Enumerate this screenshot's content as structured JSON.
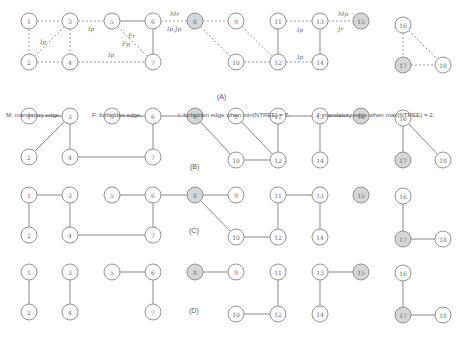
{
  "panels": [
    {
      "id": "A",
      "label": "(A)",
      "label_pos": [
        217,
        99
      ]
    },
    {
      "id": "B",
      "label": "(B)",
      "label_pos": [
        190,
        169
      ]
    },
    {
      "id": "C",
      "label": "(C)",
      "label_pos": [
        189,
        233
      ]
    },
    {
      "id": "D",
      "label": "(D)",
      "label_pos": [
        189,
        313
      ]
    }
  ],
  "legend": {
    "mandatory": "M: mandatory edge.",
    "forbidden": "F: forbidden edge.",
    "forbidden_when": "I: forbidden edge when min(NTREE) = 7.",
    "mandatory_when": "J: mandatory edge when max(NTREE) = 2."
  },
  "shaded_nodes": [
    8,
    15,
    17
  ],
  "graphs": {
    "A": {
      "nodes": [
        {
          "id": "1",
          "x": 29,
          "y": 21
        },
        {
          "id": "2",
          "x": 29,
          "y": 62
        },
        {
          "id": "3",
          "x": 70,
          "y": 21
        },
        {
          "id": "4",
          "x": 70,
          "y": 62
        },
        {
          "id": "5",
          "x": 112,
          "y": 21
        },
        {
          "id": "6",
          "x": 153,
          "y": 21
        },
        {
          "id": "7",
          "x": 153,
          "y": 62
        },
        {
          "id": "8",
          "x": 195,
          "y": 21
        },
        {
          "id": "9",
          "x": 236,
          "y": 21
        },
        {
          "id": "10",
          "x": 236,
          "y": 62
        },
        {
          "id": "11",
          "x": 278,
          "y": 21
        },
        {
          "id": "12",
          "x": 278,
          "y": 62
        },
        {
          "id": "13",
          "x": 320,
          "y": 21
        },
        {
          "id": "14",
          "x": 320,
          "y": 62
        },
        {
          "id": "15",
          "x": 361,
          "y": 21
        },
        {
          "id": "16",
          "x": 403,
          "y": 25
        },
        {
          "id": "17",
          "x": 403,
          "y": 65
        },
        {
          "id": "18",
          "x": 443,
          "y": 65
        }
      ],
      "edges": [
        {
          "a": "1",
          "b": "3",
          "style": "dashed"
        },
        {
          "a": "1",
          "b": "2",
          "style": "dashed"
        },
        {
          "a": "2",
          "b": "3",
          "style": "dashed"
        },
        {
          "a": "3",
          "b": "4",
          "style": "dashed"
        },
        {
          "a": "2",
          "b": "4",
          "style": "dashed"
        },
        {
          "a": "3",
          "b": "5",
          "style": "dashed"
        },
        {
          "a": "5",
          "b": "6",
          "style": "solid"
        },
        {
          "a": "5",
          "b": "7",
          "style": "dashed"
        },
        {
          "a": "6",
          "b": "7",
          "style": "solid"
        },
        {
          "a": "4",
          "b": "7",
          "style": "dashed"
        },
        {
          "a": "6",
          "b": "8",
          "style": "dashed"
        },
        {
          "a": "8",
          "b": "9",
          "style": "dashed"
        },
        {
          "a": "8",
          "b": "10",
          "style": "dashed"
        },
        {
          "a": "9",
          "b": "12",
          "style": "dashed"
        },
        {
          "a": "10",
          "b": "12",
          "style": "dashed"
        },
        {
          "a": "11",
          "b": "12",
          "style": "solid"
        },
        {
          "a": "11",
          "b": "13",
          "style": "dashed"
        },
        {
          "a": "12",
          "b": "14",
          "style": "dashed"
        },
        {
          "a": "13",
          "b": "14",
          "style": "solid"
        },
        {
          "a": "13",
          "b": "15",
          "style": "dashed"
        },
        {
          "a": "16",
          "b": "17",
          "style": "dashed"
        },
        {
          "a": "16",
          "b": "18",
          "style": "dashed"
        },
        {
          "a": "17",
          "b": "18",
          "style": "dashed"
        }
      ],
      "edge_labels": [
        {
          "text": "I_p",
          "x": 40,
          "y": 44
        },
        {
          "text": "I_p",
          "x": 88,
          "y": 31
        },
        {
          "text": "F_r",
          "x": 128,
          "y": 38
        },
        {
          "text": "F_p",
          "x": 122,
          "y": 46
        },
        {
          "text": "I_p",
          "x": 108,
          "y": 57
        },
        {
          "text": "M_r",
          "x": 170,
          "y": 16
        },
        {
          "text": "I_p J_p",
          "x": 167,
          "y": 31
        },
        {
          "text": "I_p",
          "x": 297,
          "y": 32
        },
        {
          "text": "I_p",
          "x": 297,
          "y": 59
        },
        {
          "text": "M_p",
          "x": 338,
          "y": 16
        },
        {
          "text": "J_r",
          "x": 338,
          "y": 31
        }
      ]
    },
    "B": {
      "nodes": [
        {
          "id": "1",
          "x": 29,
          "y": 116
        },
        {
          "id": "2",
          "x": 29,
          "y": 157
        },
        {
          "id": "3",
          "x": 70,
          "y": 116
        },
        {
          "id": "4",
          "x": 70,
          "y": 157
        },
        {
          "id": "5",
          "x": 112,
          "y": 116
        },
        {
          "id": "6",
          "x": 153,
          "y": 116
        },
        {
          "id": "7",
          "x": 153,
          "y": 157
        },
        {
          "id": "8",
          "x": 195,
          "y": 116
        },
        {
          "id": "9",
          "x": 236,
          "y": 116
        },
        {
          "id": "10",
          "x": 236,
          "y": 160
        },
        {
          "id": "11",
          "x": 278,
          "y": 116
        },
        {
          "id": "12",
          "x": 278,
          "y": 160
        },
        {
          "id": "13",
          "x": 320,
          "y": 116
        },
        {
          "id": "14",
          "x": 320,
          "y": 160
        },
        {
          "id": "15",
          "x": 361,
          "y": 116
        },
        {
          "id": "16",
          "x": 403,
          "y": 118
        },
        {
          "id": "17",
          "x": 403,
          "y": 160
        },
        {
          "id": "18",
          "x": 443,
          "y": 160
        }
      ],
      "edges": [
        {
          "a": "1",
          "b": "3"
        },
        {
          "a": "3",
          "b": "2"
        },
        {
          "a": "3",
          "b": "4"
        },
        {
          "a": "4",
          "b": "7"
        },
        {
          "a": "5",
          "b": "6"
        },
        {
          "a": "6",
          "b": "7"
        },
        {
          "a": "6",
          "b": "8"
        },
        {
          "a": "8",
          "b": "10"
        },
        {
          "a": "9",
          "b": "12"
        },
        {
          "a": "10",
          "b": "12"
        },
        {
          "a": "11",
          "b": "12"
        },
        {
          "a": "11",
          "b": "13"
        },
        {
          "a": "13",
          "b": "14"
        },
        {
          "a": "13",
          "b": "15"
        },
        {
          "a": "16",
          "b": "17"
        },
        {
          "a": "16",
          "b": "18"
        }
      ]
    },
    "C": {
      "nodes": [
        {
          "id": "1",
          "x": 29,
          "y": 195
        },
        {
          "id": "2",
          "x": 29,
          "y": 235
        },
        {
          "id": "3",
          "x": 70,
          "y": 195
        },
        {
          "id": "4",
          "x": 70,
          "y": 235
        },
        {
          "id": "5",
          "x": 112,
          "y": 195
        },
        {
          "id": "6",
          "x": 153,
          "y": 195
        },
        {
          "id": "7",
          "x": 153,
          "y": 235
        },
        {
          "id": "8",
          "x": 195,
          "y": 195
        },
        {
          "id": "9",
          "x": 236,
          "y": 195
        },
        {
          "id": "10",
          "x": 236,
          "y": 237
        },
        {
          "id": "11",
          "x": 278,
          "y": 195
        },
        {
          "id": "12",
          "x": 278,
          "y": 237
        },
        {
          "id": "13",
          "x": 320,
          "y": 195
        },
        {
          "id": "14",
          "x": 320,
          "y": 237
        },
        {
          "id": "15",
          "x": 361,
          "y": 195
        },
        {
          "id": "16",
          "x": 403,
          "y": 196
        },
        {
          "id": "17",
          "x": 403,
          "y": 239
        },
        {
          "id": "18",
          "x": 443,
          "y": 239
        }
      ],
      "edges": [
        {
          "a": "1",
          "b": "3"
        },
        {
          "a": "1",
          "b": "2"
        },
        {
          "a": "3",
          "b": "4"
        },
        {
          "a": "4",
          "b": "7"
        },
        {
          "a": "5",
          "b": "6"
        },
        {
          "a": "6",
          "b": "7"
        },
        {
          "a": "6",
          "b": "8"
        },
        {
          "a": "8",
          "b": "9"
        },
        {
          "a": "8",
          "b": "10"
        },
        {
          "a": "10",
          "b": "12"
        },
        {
          "a": "11",
          "b": "12"
        },
        {
          "a": "11",
          "b": "13"
        },
        {
          "a": "13",
          "b": "14"
        },
        {
          "a": "16",
          "b": "17"
        },
        {
          "a": "17",
          "b": "18"
        }
      ]
    },
    "D": {
      "nodes": [
        {
          "id": "1",
          "x": 29,
          "y": 272
        },
        {
          "id": "2",
          "x": 29,
          "y": 312
        },
        {
          "id": "3",
          "x": 70,
          "y": 272
        },
        {
          "id": "4",
          "x": 70,
          "y": 312
        },
        {
          "id": "5",
          "x": 112,
          "y": 272
        },
        {
          "id": "6",
          "x": 153,
          "y": 272
        },
        {
          "id": "7",
          "x": 153,
          "y": 312
        },
        {
          "id": "8",
          "x": 195,
          "y": 272
        },
        {
          "id": "9",
          "x": 236,
          "y": 272
        },
        {
          "id": "10",
          "x": 236,
          "y": 314
        },
        {
          "id": "11",
          "x": 278,
          "y": 272
        },
        {
          "id": "12",
          "x": 278,
          "y": 314
        },
        {
          "id": "13",
          "x": 320,
          "y": 272
        },
        {
          "id": "14",
          "x": 320,
          "y": 314
        },
        {
          "id": "15",
          "x": 361,
          "y": 272
        },
        {
          "id": "16",
          "x": 403,
          "y": 273
        },
        {
          "id": "17",
          "x": 403,
          "y": 315
        },
        {
          "id": "18",
          "x": 443,
          "y": 315
        }
      ],
      "edges": [
        {
          "a": "1",
          "b": "2"
        },
        {
          "a": "3",
          "b": "4"
        },
        {
          "a": "5",
          "b": "6"
        },
        {
          "a": "6",
          "b": "7"
        },
        {
          "a": "8",
          "b": "9"
        },
        {
          "a": "11",
          "b": "12"
        },
        {
          "a": "10",
          "b": "12"
        },
        {
          "a": "13",
          "b": "15"
        },
        {
          "a": "13",
          "b": "14"
        },
        {
          "a": "16",
          "b": "17"
        },
        {
          "a": "17",
          "b": "18"
        }
      ]
    }
  }
}
